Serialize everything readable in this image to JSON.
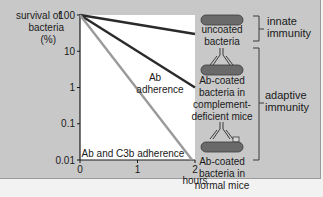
{
  "chart_data": {
    "type": "line",
    "title": "",
    "ylabel": "survival of bacteria (%)",
    "xlabel": "hours",
    "yscale": "log",
    "ylim": [
      0.01,
      100
    ],
    "xlim": [
      0,
      2
    ],
    "yticks": [
      {
        "value": 100,
        "label": "100"
      },
      {
        "value": 10,
        "label": "10"
      },
      {
        "value": 1,
        "label": "1"
      },
      {
        "value": 0.1,
        "label": "0.1"
      },
      {
        "value": 0.01,
        "label": "0.01"
      }
    ],
    "xticks": [
      {
        "value": 0,
        "label": "0"
      },
      {
        "value": 1,
        "label": "1"
      },
      {
        "value": 2,
        "label": "2"
      }
    ],
    "series": [
      {
        "name": "uncoated bacteria",
        "color": "#2a2a2a",
        "points": [
          [
            0,
            100
          ],
          [
            2,
            30
          ]
        ]
      },
      {
        "name": "Ab adherence",
        "color": "#2a2a2a",
        "points": [
          [
            0,
            100
          ],
          [
            2,
            1
          ]
        ]
      },
      {
        "name": "Ab and C3b adherence",
        "color": "#9a9a9a",
        "points": [
          [
            0,
            100
          ],
          [
            1.95,
            0.01
          ]
        ]
      }
    ],
    "annotations": [
      {
        "text_lines": [
          "Ab",
          "adherence"
        ],
        "series": "Ab adherence"
      },
      {
        "text_lines": [
          "Ab and C3b adherence"
        ],
        "series": "Ab and C3b adherence"
      }
    ],
    "grid": false
  },
  "legend": {
    "items": [
      {
        "icon": "uncoated-bacterium-icon",
        "lines": [
          "uncoated",
          "bacteria"
        ]
      },
      {
        "icon": "ab-coated-bacterium-icon",
        "lines": [
          "Ab-coated",
          "bacteria in",
          "complement-",
          "deficient mice"
        ]
      },
      {
        "icon": "ab-c3b-coated-bacterium-icon",
        "lines": [
          "Ab-coated",
          "bacteria in",
          "normal mice"
        ]
      }
    ],
    "groups": [
      {
        "lines": [
          "innate",
          "immunity"
        ]
      },
      {
        "lines": [
          "adaptive",
          "immunity"
        ]
      }
    ]
  },
  "ylabel_lines": [
    "survival of",
    "bacteria",
    "(%)"
  ],
  "colors": {
    "panel": "#c8c8c8",
    "plot": "#ffffff",
    "dark_line": "#2a2a2a",
    "light_line": "#9a9a9a",
    "bacterium": "#6a6a6a"
  }
}
